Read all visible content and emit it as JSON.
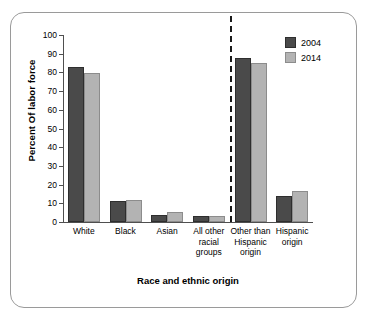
{
  "chart_data": {
    "type": "bar",
    "title": "",
    "xlabel": "Race and ethnic origin",
    "ylabel": "Percent Of labor force",
    "ylim": [
      0,
      100
    ],
    "ytick_step": 10,
    "yticks": [
      "0",
      "10",
      "20",
      "30",
      "40",
      "50",
      "60",
      "70",
      "80",
      "90",
      "100"
    ],
    "grid": false,
    "legend_position": "top-right",
    "categories": [
      "White",
      "Black",
      "Asian",
      "All other racial groups",
      "Other than Hispanic origin",
      "Hispanic origin"
    ],
    "category_lines": [
      [
        "White"
      ],
      [
        "Black"
      ],
      [
        "Asian"
      ],
      [
        "All other",
        "racial",
        "groups"
      ],
      [
        "Other than",
        "Hispanic",
        "origin"
      ],
      [
        "Hispanic",
        "origin"
      ]
    ],
    "series": [
      {
        "name": "2004",
        "color": "#4a4a4a",
        "values": [
          83,
          11,
          4,
          3,
          87.5,
          14
        ]
      },
      {
        "name": "2014",
        "color": "#b3b3b3",
        "values": [
          79.5,
          12,
          5.5,
          3,
          85,
          16.5
        ]
      }
    ],
    "annotations": [
      {
        "type": "divider",
        "style": "vertical-dashed",
        "after_category": "All other racial groups",
        "color": "#1a1a1a"
      }
    ]
  },
  "legend": {
    "items": [
      {
        "label": "2004",
        "swatch": "dark-gray-swatch"
      },
      {
        "label": "2014",
        "swatch": "light-gray-swatch"
      }
    ]
  }
}
